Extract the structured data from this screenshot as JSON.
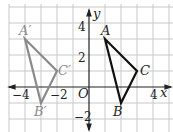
{
  "diagram": {
    "type": "coordinate-plane-reflection",
    "axes": {
      "x_label": "x",
      "y_label": "y",
      "origin_label": "O",
      "x_ticks": [
        "−4",
        "−2",
        "4"
      ],
      "y_ticks": [
        "4",
        "2",
        "−2"
      ]
    },
    "triangle": {
      "color": "#111111",
      "points": {
        "A": [
          1,
          3
        ],
        "B": [
          2,
          -1
        ],
        "C": [
          3,
          1
        ]
      },
      "labels": {
        "A": "A",
        "B": "B",
        "C": "C"
      }
    },
    "image_triangle": {
      "color": "#8a8a8a",
      "points": {
        "A'": [
          -4,
          3
        ],
        "B'": [
          -3,
          -1
        ],
        "C'": [
          -2,
          1
        ]
      },
      "labels": {
        "A": "A′",
        "B": "B′",
        "C": "C′"
      }
    }
  }
}
